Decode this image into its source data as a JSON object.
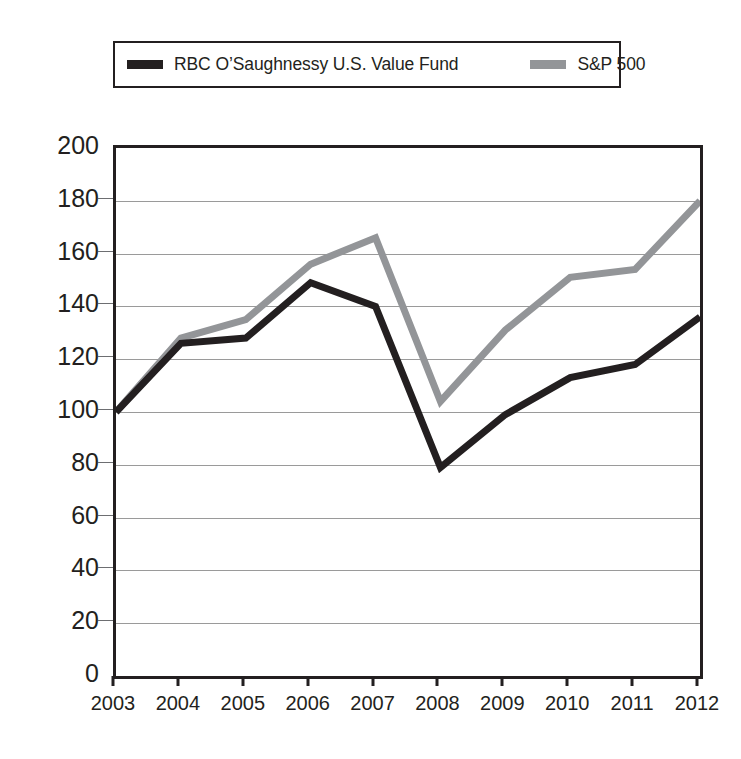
{
  "legend": {
    "entries": [
      {
        "label": "RBC O’Saughnessy U.S. Value Fund",
        "color": "#231f20",
        "swatch_name": "legend-swatch-fund"
      },
      {
        "label": "S&P 500",
        "color": "#939598",
        "swatch_name": "legend-swatch-sp500"
      }
    ]
  },
  "axes": {
    "y_ticks": [
      "200",
      "180",
      "160",
      "140",
      "120",
      "100",
      "80",
      "60",
      "40",
      "20",
      "0"
    ],
    "x_ticks": [
      "2003",
      "2004",
      "2005",
      "2006",
      "2007",
      "2008",
      "2009",
      "2010",
      "2011",
      "2012"
    ]
  },
  "chart_data": {
    "type": "line",
    "title": "",
    "xlabel": "",
    "ylabel": "",
    "x": [
      2003,
      2004,
      2005,
      2006,
      2007,
      2008,
      2009,
      2010,
      2011,
      2012
    ],
    "categories": [
      "2003",
      "2004",
      "2005",
      "2006",
      "2007",
      "2008",
      "2009",
      "2010",
      "2011",
      "2012"
    ],
    "ylim": [
      0,
      200
    ],
    "ytick_step": 20,
    "grid": true,
    "legend_position": "top",
    "series": [
      {
        "name": "RBC O’Saughnessy U.S. Value Fund",
        "color": "#231f20",
        "line_width": 7,
        "values": [
          100,
          126,
          128,
          149,
          140,
          79,
          99,
          113,
          118,
          136
        ]
      },
      {
        "name": "S&P 500",
        "color": "#939598",
        "line_width": 7,
        "values": [
          100,
          128,
          135,
          156,
          166,
          104,
          131,
          151,
          154,
          180
        ]
      }
    ]
  }
}
